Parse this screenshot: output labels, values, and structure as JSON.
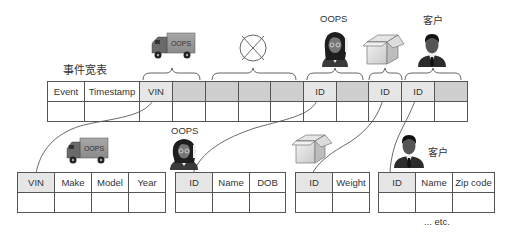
{
  "diagram": {
    "main_table": {
      "title": "事件宽表",
      "headers": [
        "Event",
        "Timestamp",
        "VIN",
        "",
        "",
        "",
        "",
        "ID",
        "",
        "ID",
        "ID",
        ""
      ],
      "cell_types": [
        "plain",
        "plain",
        "key",
        "gray",
        "gray",
        "gray",
        "gray",
        "key",
        "gray",
        "key",
        "key",
        "gray"
      ]
    },
    "groups": [
      {
        "icon": "truck-icon",
        "label": "",
        "truck_text": "OOPS",
        "covers": "VIN"
      },
      {
        "icon": "crossed-circle-icon",
        "label": "",
        "covers": "unused columns"
      },
      {
        "icon": "person-woman-icon",
        "label": "OOPS",
        "covers": "ID"
      },
      {
        "icon": "box-icon",
        "label": "",
        "covers": "ID"
      },
      {
        "icon": "person-man-icon",
        "label": "客户",
        "covers": "ID"
      }
    ],
    "child_tables": [
      {
        "name": "vehicle",
        "icon_text": "OOPS",
        "headers": [
          "VIN",
          "Make",
          "Model",
          "Year"
        ]
      },
      {
        "name": "person",
        "label": "OOPS",
        "headers": [
          "ID",
          "Name",
          "DOB"
        ]
      },
      {
        "name": "package",
        "headers": [
          "ID",
          "Weight"
        ]
      },
      {
        "name": "customer",
        "label": "客户",
        "headers": [
          "ID",
          "Name",
          "Zip code"
        ]
      }
    ],
    "footer": "... etc."
  },
  "colors": {
    "key_cell": "#e6e6e6",
    "gray_cell": "#cfcfcf",
    "line": "#555555"
  }
}
